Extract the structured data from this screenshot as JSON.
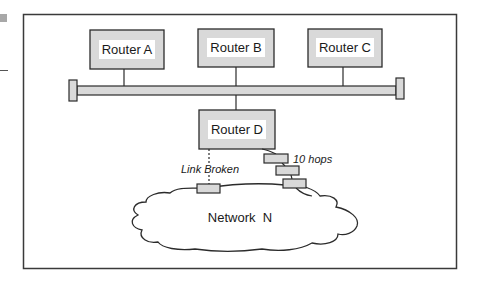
{
  "diagram": {
    "routers": [
      {
        "id": "A",
        "label": "Router A"
      },
      {
        "id": "B",
        "label": "Router B"
      },
      {
        "id": "C",
        "label": "Router C"
      },
      {
        "id": "D",
        "label": "Router D"
      }
    ],
    "annotations": {
      "link_broken": "Link Broken",
      "hops": "10 hops"
    },
    "network": {
      "label": "Network  N"
    },
    "colors": {
      "box_fill": "#d9d9d9",
      "label_bg": "#ffffff",
      "stroke": "#2b2b2b",
      "frame": "#3a3a3a"
    }
  }
}
